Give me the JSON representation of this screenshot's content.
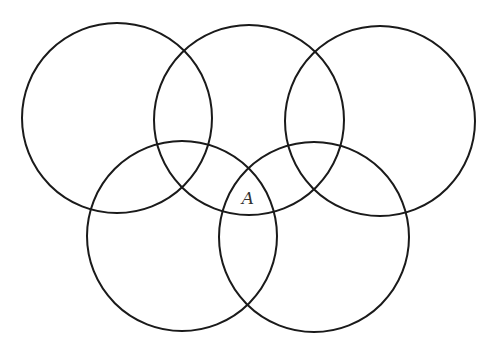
{
  "diagram": {
    "stroke_color": "#1a1a1a",
    "circles": [
      {
        "id": "top-left",
        "cx": 117,
        "cy": 118,
        "r": 95
      },
      {
        "id": "top-middle",
        "cx": 249,
        "cy": 120,
        "r": 95
      },
      {
        "id": "top-right",
        "cx": 380,
        "cy": 121,
        "r": 95
      },
      {
        "id": "bottom-left",
        "cx": 182,
        "cy": 236,
        "r": 95
      },
      {
        "id": "bottom-right",
        "cx": 314,
        "cy": 237,
        "r": 95
      }
    ],
    "labels": [
      {
        "text": "A",
        "x": 248,
        "y": 204
      }
    ]
  }
}
